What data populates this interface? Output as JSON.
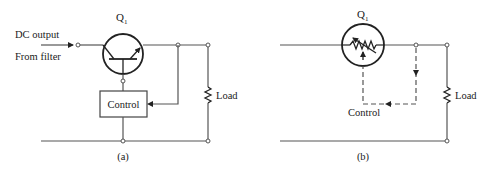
{
  "figure": {
    "panel_a": {
      "caption": "(a)",
      "transistor_label": "Q",
      "transistor_subscript": "1",
      "input_label_line1": "DC output",
      "input_label_line2": "From filter",
      "control_block_label": "Control",
      "load_label": "Load"
    },
    "panel_b": {
      "caption": "(b)",
      "transistor_label": "Q",
      "transistor_subscript": "1",
      "control_label": "Control",
      "load_label": "Load"
    }
  }
}
